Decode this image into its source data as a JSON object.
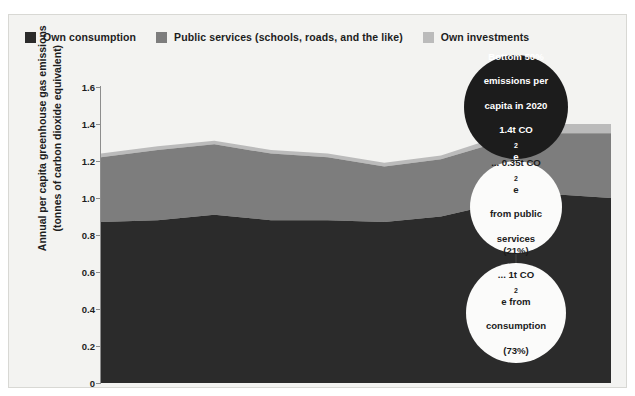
{
  "legend": {
    "items": [
      {
        "label": "Own consumption",
        "color": "#2b2b2b",
        "name": "legend-own-consumption"
      },
      {
        "label": "Public services (schools, roads, and the like)",
        "color": "#7d7d7d",
        "name": "legend-public-services"
      },
      {
        "label": "Own investments",
        "color": "#bbbbbb",
        "name": "legend-own-investments"
      }
    ]
  },
  "axes": {
    "ylabel_line1": "Annual per capita greenhouse gas emissions",
    "ylabel_line2": "(tonnes of carbon dioxide equivalent)",
    "yticks": [
      "0",
      "0.2",
      "0.4",
      "0.6",
      "0.8",
      "1.0",
      "1.2",
      "1.4",
      "1.6"
    ],
    "xticks": [
      "1975",
      "1980",
      "1985",
      "1990",
      "1995",
      "2000",
      "2005",
      "2010",
      "2015",
      "2020"
    ]
  },
  "annotations": [
    {
      "id": "total-2020",
      "line1": "Bottom 50%",
      "line2": "emissions per",
      "line3": "capita in 2020",
      "line4_pre": "1.4t CO",
      "line4_sub": "2",
      "line4_post": "e",
      "style": "dark"
    },
    {
      "id": "public-services-share",
      "line1_pre": "... 0.35t CO",
      "line1_sub": "2",
      "line1_post": "e",
      "line2": "from public",
      "line3": "services (21%)",
      "style": "light"
    },
    {
      "id": "consumption-share",
      "line1_pre": "... 1t CO",
      "line1_sub": "2",
      "line1_post": "e from",
      "line2": "consumption",
      "line3": "(73%)",
      "style": "light"
    }
  ],
  "chart_data": {
    "type": "area",
    "stacked": true,
    "title": "",
    "xlabel": "",
    "ylabel": "Annual per capita greenhouse gas emissions (tonnes of carbon dioxide equivalent)",
    "xlim": [
      1975,
      2020
    ],
    "ylim": [
      0,
      1.6
    ],
    "grid": false,
    "legend_position": "top-left",
    "x": [
      1975,
      1980,
      1985,
      1990,
      1995,
      2000,
      2005,
      2010,
      2015,
      2020
    ],
    "series": [
      {
        "name": "Own consumption",
        "color": "#2b2b2b",
        "values": [
          0.87,
          0.88,
          0.91,
          0.88,
          0.88,
          0.87,
          0.9,
          0.97,
          1.02,
          1.0
        ]
      },
      {
        "name": "Public services (schools, roads, and the like)",
        "color": "#7d7d7d",
        "values": [
          0.35,
          0.38,
          0.38,
          0.36,
          0.34,
          0.3,
          0.31,
          0.33,
          0.33,
          0.35
        ]
      },
      {
        "name": "Own investments",
        "color": "#bbbbbb",
        "values": [
          0.02,
          0.02,
          0.02,
          0.02,
          0.02,
          0.02,
          0.02,
          0.03,
          0.05,
          0.05
        ]
      }
    ],
    "totals": [
      1.24,
      1.28,
      1.31,
      1.26,
      1.24,
      1.19,
      1.23,
      1.33,
      1.4,
      1.4
    ]
  }
}
